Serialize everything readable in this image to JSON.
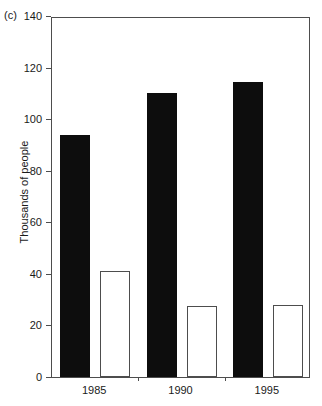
{
  "figure": {
    "panel_label": "(c)"
  },
  "chart_data": {
    "type": "bar",
    "title": "",
    "subtitle": "",
    "xlabel": "",
    "ylabel": "Thousands of people",
    "categories": [
      "1985",
      "1990",
      "1995"
    ],
    "series": [
      {
        "name": "filled",
        "fill": "#0d0d0d",
        "values": [
          94,
          110,
          114.5
        ]
      },
      {
        "name": "open",
        "fill": "#ffffff",
        "values": [
          41,
          27.5,
          28
        ]
      }
    ],
    "ylim": [
      0,
      140
    ],
    "yticks": [
      0,
      20,
      40,
      60,
      80,
      100,
      120,
      140
    ],
    "ytick_labels": [
      "0",
      "20",
      "40",
      "60",
      "80",
      "100",
      "120",
      "140"
    ],
    "xtick_labels": [
      "1985",
      "1990",
      "1995"
    ],
    "grid": false,
    "legend": "none",
    "frame": "box",
    "axis_color": "#4d4d4d"
  }
}
